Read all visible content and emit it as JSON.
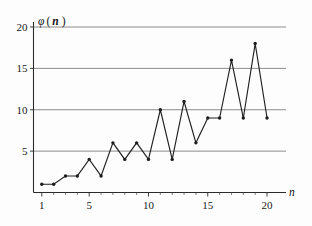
{
  "chart_data": {
    "type": "line",
    "title": "",
    "subtitle": "",
    "xlabel": "n",
    "ylabel": "φ( n )",
    "x": [
      1,
      2,
      3,
      4,
      5,
      6,
      7,
      8,
      9,
      10,
      11,
      12,
      13,
      14,
      15,
      16,
      17,
      18,
      19,
      20
    ],
    "values": [
      1,
      1,
      2,
      2,
      4,
      2,
      6,
      4,
      6,
      4,
      10,
      4,
      11,
      6,
      9,
      9,
      16,
      9,
      18,
      9
    ],
    "series": [
      {
        "name": "φ( n )",
        "values": [
          1,
          1,
          2,
          2,
          4,
          2,
          6,
          4,
          6,
          4,
          10,
          4,
          11,
          6,
          9,
          9,
          16,
          9,
          18,
          9
        ]
      }
    ],
    "xlim": [
      0.3,
      21.6
    ],
    "ylim": [
      0,
      20
    ],
    "x_ticks": [
      1,
      5,
      10,
      15,
      20
    ],
    "x_tick_labels": [
      "1",
      "5",
      "10",
      "15",
      "20"
    ],
    "x_minor_ticks": [
      2,
      3,
      4,
      6,
      7,
      8,
      9,
      11,
      12,
      13,
      14,
      16,
      17,
      18,
      19
    ],
    "y_ticks": [
      5,
      10,
      15,
      20
    ],
    "y_tick_labels": [
      "5",
      "10",
      "15",
      "20"
    ],
    "gridlines": [
      5,
      10,
      15,
      20
    ],
    "grid": true,
    "grid_axis": "y",
    "legend": false,
    "legend_position": "none",
    "markers": true,
    "marker_shape": "circle",
    "line_color": "#222222",
    "marker_color": "#1c1c1c",
    "grid_color": "#6f6f6f",
    "axis_color": "#2b2b2b",
    "background_color": "#fdfdfd",
    "annotations": []
  },
  "axis_labels": {
    "y_symbol": "φ",
    "y_open_paren": "(",
    "y_variable": "n",
    "y_close_paren": ")",
    "x_variable": "n"
  }
}
